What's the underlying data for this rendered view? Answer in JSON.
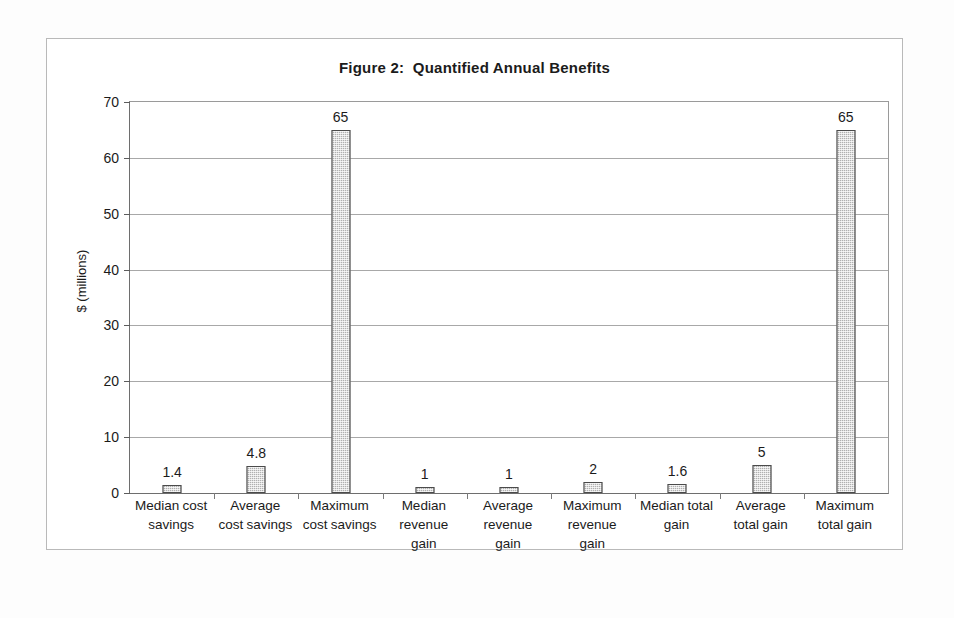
{
  "chart_data": {
    "type": "bar",
    "title": "Figure 2:  Quantified Annual Benefits",
    "xlabel": "",
    "ylabel": "$ (millions)",
    "ylim": [
      0,
      70
    ],
    "ytick_step": 10,
    "yticks": [
      "0",
      "10",
      "20",
      "30",
      "40",
      "50",
      "60",
      "70"
    ],
    "grid": true,
    "legend": false,
    "categories": [
      "Median cost savings",
      "Average cost savings",
      "Maximum cost savings",
      "Median revenue gain",
      "Average revenue gain",
      "Maximum revenue gain",
      "Median total gain",
      "Average total gain",
      "Maximum total gain"
    ],
    "category_lines": [
      [
        "Median cost",
        "savings"
      ],
      [
        "Average",
        "cost savings"
      ],
      [
        "Maximum",
        "cost savings"
      ],
      [
        "Median",
        "revenue",
        "gain"
      ],
      [
        "Average",
        "revenue",
        "gain"
      ],
      [
        "Maximum",
        "revenue",
        "gain"
      ],
      [
        "Median total",
        "gain"
      ],
      [
        "Average",
        "total gain"
      ],
      [
        "Maximum",
        "total gain"
      ]
    ],
    "values": [
      1.4,
      4.8,
      65,
      1,
      1,
      2,
      1.6,
      5,
      65
    ],
    "value_labels": [
      "1.4",
      "4.8",
      "65",
      "1",
      "1",
      "2",
      "1.6",
      "5",
      "65"
    ],
    "bar_fill_color": "#b0b0b0",
    "bar_border_color": "#4b4b4b",
    "axis_color": "#6e6e6e",
    "gridline_color": "#a8a8a8",
    "plot_background": "#ffffff"
  }
}
